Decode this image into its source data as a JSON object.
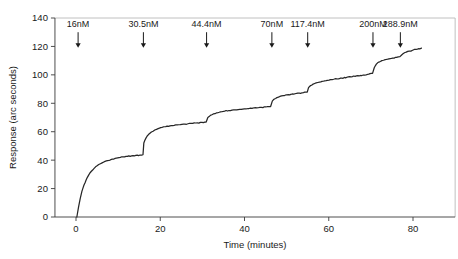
{
  "chart_data": {
    "type": "line",
    "title": "",
    "xlabel": "Time (minutes)",
    "ylabel": "Response (arc seconds)",
    "xlim": [
      -5,
      90
    ],
    "ylim": [
      0,
      140
    ],
    "xticks": [
      0,
      20,
      40,
      60,
      80
    ],
    "yticks": [
      0,
      20,
      40,
      60,
      80,
      100,
      120,
      140
    ],
    "xtick_labels": [
      "0",
      "20",
      "40",
      "60",
      "80"
    ],
    "ytick_labels": [
      "0",
      "20",
      "40",
      "60",
      "80",
      "100",
      "120",
      "140"
    ],
    "grid": false,
    "legend": null,
    "series": [
      {
        "name": "Response",
        "x": [
          0.2,
          0.6,
          1.0,
          1.4,
          1.9,
          2.4,
          3.0,
          3.6,
          4.3,
          5.0,
          5.8,
          6.6,
          7.5,
          8.4,
          9.3,
          10.2,
          11.2,
          12.2,
          13.2,
          14.2,
          15.2,
          15.9,
          16.1,
          16.6,
          17.2,
          17.9,
          18.7,
          19.5,
          20.4,
          21.3,
          22.3,
          23.3,
          24.4,
          25.5,
          26.6,
          27.7,
          28.8,
          29.9,
          30.9,
          31.3,
          31.9,
          32.6,
          33.4,
          34.3,
          35.3,
          36.3,
          37.4,
          38.5,
          39.6,
          40.7,
          41.8,
          42.9,
          44.0,
          45.1,
          46.2,
          46.6,
          47.1,
          47.7,
          48.4,
          49.2,
          50.1,
          51.0,
          52.0,
          53.0,
          54.0,
          54.9,
          55.2,
          55.7,
          56.3,
          57.0,
          57.8,
          58.7,
          59.7,
          60.8,
          61.9,
          63.1,
          64.3,
          65.6,
          66.9,
          68.2,
          69.5,
          70.4,
          70.8,
          71.3,
          71.9,
          72.6,
          73.4,
          74.3,
          75.2,
          76.1,
          76.9,
          77.3,
          77.8,
          78.4,
          79.1,
          79.9,
          80.7,
          81.4,
          82.0
        ],
        "y": [
          0.0,
          7.0,
          13.0,
          18.0,
          22.5,
          26.0,
          29.5,
          32.0,
          34.2,
          36.0,
          37.5,
          38.7,
          39.7,
          40.5,
          41.2,
          41.8,
          42.3,
          42.7,
          43.0,
          43.3,
          43.6,
          43.8,
          52.0,
          55.5,
          58.0,
          59.8,
          61.2,
          62.2,
          63.0,
          63.6,
          64.1,
          64.5,
          64.9,
          65.3,
          65.6,
          65.9,
          66.2,
          66.5,
          66.8,
          70.0,
          71.5,
          72.5,
          73.3,
          74.0,
          74.5,
          74.9,
          75.3,
          75.6,
          75.9,
          76.2,
          76.5,
          76.8,
          77.1,
          77.4,
          77.7,
          81.5,
          83.0,
          84.0,
          84.8,
          85.4,
          85.9,
          86.3,
          86.7,
          87.1,
          87.5,
          87.9,
          91.0,
          92.5,
          93.5,
          94.3,
          94.9,
          95.5,
          96.1,
          96.6,
          97.2,
          97.7,
          98.3,
          98.8,
          99.4,
          99.9,
          100.5,
          101.0,
          105.0,
          107.5,
          109.0,
          110.0,
          110.7,
          111.3,
          111.8,
          112.3,
          112.8,
          114.0,
          115.2,
          116.0,
          116.7,
          117.3,
          117.9,
          118.4,
          118.8
        ]
      }
    ],
    "annotations": [
      {
        "label": "16nM",
        "x": 0.5,
        "arrow_top": 130,
        "arrow_bottom": 119
      },
      {
        "label": "30.5nM",
        "x": 16.0,
        "arrow_top": 130,
        "arrow_bottom": 119
      },
      {
        "label": "44.4nM",
        "x": 31.0,
        "arrow_top": 130,
        "arrow_bottom": 119
      },
      {
        "label": "70nM",
        "x": 46.5,
        "arrow_top": 130,
        "arrow_bottom": 119
      },
      {
        "label": "117.4nM",
        "x": 55.0,
        "arrow_top": 130,
        "arrow_bottom": 119
      },
      {
        "label": "200nM",
        "x": 70.5,
        "arrow_top": 130,
        "arrow_bottom": 119
      },
      {
        "label": "288.9nM",
        "x": 77.0,
        "arrow_top": 130,
        "arrow_bottom": 119
      }
    ],
    "plateaus": [
      44,
      67,
      78,
      88,
      101,
      113,
      119
    ],
    "colors": {
      "trace": "#262626",
      "axis": "#3a3a3a",
      "frame": "#b9b9b9",
      "background": "#ffffff"
    }
  }
}
